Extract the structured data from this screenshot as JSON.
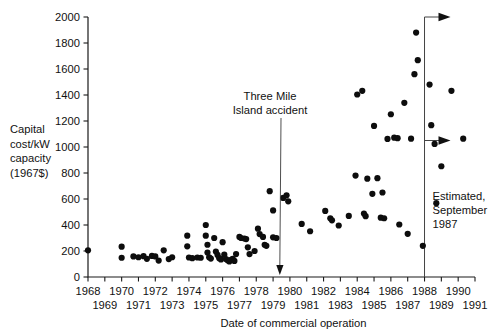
{
  "chart_data": {
    "type": "scatter",
    "title": "",
    "xlabel": "Date of commercial operation",
    "ylabel": "Capital cost/kW capacity (1967$)",
    "ylabel_lines": [
      "Capital",
      "cost/kW",
      "capacity",
      "(1967$)"
    ],
    "xlim": [
      1968,
      1991
    ],
    "ylim": [
      0,
      2000
    ],
    "grid": false,
    "legend": null,
    "ytick_values": [
      0,
      200,
      400,
      600,
      800,
      1000,
      1200,
      1400,
      1600,
      1800,
      2000
    ],
    "ytick_labels": [
      "0",
      "200",
      "400",
      "600",
      "800",
      "1000",
      "1200",
      "1400",
      "1600",
      "1800",
      "2000"
    ],
    "xtick_values": [
      1968,
      1969,
      1970,
      1971,
      1972,
      1973,
      1974,
      1975,
      1976,
      1977,
      1978,
      1979,
      1980,
      1981,
      1982,
      1983,
      1984,
      1985,
      1986,
      1987,
      1988,
      1989,
      1990,
      1991
    ],
    "xtick_labels_upper": [
      "1968",
      "1970",
      "1972",
      "1974",
      "1976",
      "1978",
      "1980",
      "1982",
      "1984",
      "1986",
      "1988",
      "1990"
    ],
    "xtick_labels_lower": [
      "1969",
      "1971",
      "1973",
      "1975",
      "1977",
      "1979",
      "1981",
      "1983",
      "1985",
      "1987",
      "1989",
      "1991"
    ],
    "annotations": [
      {
        "name": "three-mile-island",
        "lines": [
          "Three Mile",
          "Island accident"
        ],
        "text": "Three Mile Island accident",
        "points_to_x": 1979.4,
        "points_to_y": 0
      },
      {
        "name": "estimated-september-1987",
        "lines": [
          "Estimated,",
          "September",
          "1987"
        ],
        "text": "Estimated, September 1987",
        "marker_x": 1988.0
      }
    ],
    "reference_line": {
      "x": 1988.0,
      "y_from": 0,
      "y_to": 2000,
      "arrows_at_y": [
        2000,
        1050
      ]
    },
    "points": [
      {
        "x": 1968.0,
        "y": 205
      },
      {
        "x": 1970.0,
        "y": 233
      },
      {
        "x": 1970.0,
        "y": 148
      },
      {
        "x": 1970.7,
        "y": 158
      },
      {
        "x": 1971.0,
        "y": 152
      },
      {
        "x": 1971.3,
        "y": 160
      },
      {
        "x": 1971.5,
        "y": 140
      },
      {
        "x": 1971.8,
        "y": 162
      },
      {
        "x": 1972.0,
        "y": 158
      },
      {
        "x": 1972.2,
        "y": 126
      },
      {
        "x": 1972.5,
        "y": 205
      },
      {
        "x": 1972.8,
        "y": 138
      },
      {
        "x": 1973.0,
        "y": 152
      },
      {
        "x": 1973.9,
        "y": 318
      },
      {
        "x": 1973.9,
        "y": 236
      },
      {
        "x": 1974.0,
        "y": 150
      },
      {
        "x": 1974.2,
        "y": 145
      },
      {
        "x": 1974.5,
        "y": 150
      },
      {
        "x": 1974.7,
        "y": 148
      },
      {
        "x": 1975.0,
        "y": 400
      },
      {
        "x": 1975.0,
        "y": 318
      },
      {
        "x": 1975.1,
        "y": 248
      },
      {
        "x": 1975.1,
        "y": 188
      },
      {
        "x": 1975.2,
        "y": 152
      },
      {
        "x": 1975.3,
        "y": 142
      },
      {
        "x": 1975.5,
        "y": 300
      },
      {
        "x": 1975.6,
        "y": 196
      },
      {
        "x": 1975.7,
        "y": 170
      },
      {
        "x": 1975.8,
        "y": 145
      },
      {
        "x": 1975.9,
        "y": 135
      },
      {
        "x": 1976.0,
        "y": 268
      },
      {
        "x": 1976.1,
        "y": 172
      },
      {
        "x": 1976.2,
        "y": 138
      },
      {
        "x": 1976.3,
        "y": 128
      },
      {
        "x": 1976.4,
        "y": 120
      },
      {
        "x": 1976.5,
        "y": 132
      },
      {
        "x": 1976.6,
        "y": 140
      },
      {
        "x": 1976.7,
        "y": 124
      },
      {
        "x": 1976.8,
        "y": 176
      },
      {
        "x": 1977.0,
        "y": 308
      },
      {
        "x": 1977.1,
        "y": 300
      },
      {
        "x": 1977.3,
        "y": 296
      },
      {
        "x": 1977.4,
        "y": 292
      },
      {
        "x": 1977.5,
        "y": 228
      },
      {
        "x": 1977.6,
        "y": 176
      },
      {
        "x": 1977.9,
        "y": 200
      },
      {
        "x": 1978.1,
        "y": 372
      },
      {
        "x": 1978.2,
        "y": 330
      },
      {
        "x": 1978.4,
        "y": 308
      },
      {
        "x": 1978.5,
        "y": 248
      },
      {
        "x": 1978.6,
        "y": 240
      },
      {
        "x": 1978.8,
        "y": 660
      },
      {
        "x": 1979.0,
        "y": 512
      },
      {
        "x": 1979.0,
        "y": 305
      },
      {
        "x": 1979.2,
        "y": 300
      },
      {
        "x": 1979.6,
        "y": 608
      },
      {
        "x": 1979.8,
        "y": 628
      },
      {
        "x": 1979.9,
        "y": 582
      },
      {
        "x": 1980.7,
        "y": 408
      },
      {
        "x": 1981.2,
        "y": 352
      },
      {
        "x": 1982.1,
        "y": 508
      },
      {
        "x": 1982.4,
        "y": 452
      },
      {
        "x": 1982.5,
        "y": 436
      },
      {
        "x": 1982.9,
        "y": 396
      },
      {
        "x": 1983.5,
        "y": 470
      },
      {
        "x": 1983.9,
        "y": 780
      },
      {
        "x": 1984.0,
        "y": 1404
      },
      {
        "x": 1984.3,
        "y": 1432
      },
      {
        "x": 1984.4,
        "y": 488
      },
      {
        "x": 1984.5,
        "y": 468
      },
      {
        "x": 1984.6,
        "y": 756
      },
      {
        "x": 1984.9,
        "y": 640
      },
      {
        "x": 1985.0,
        "y": 1162
      },
      {
        "x": 1985.2,
        "y": 760
      },
      {
        "x": 1985.4,
        "y": 456
      },
      {
        "x": 1985.5,
        "y": 650
      },
      {
        "x": 1985.6,
        "y": 452
      },
      {
        "x": 1985.8,
        "y": 1062
      },
      {
        "x": 1986.0,
        "y": 1252
      },
      {
        "x": 1986.2,
        "y": 1072
      },
      {
        "x": 1986.4,
        "y": 1068
      },
      {
        "x": 1986.5,
        "y": 404
      },
      {
        "x": 1986.8,
        "y": 1340
      },
      {
        "x": 1987.0,
        "y": 332
      },
      {
        "x": 1987.2,
        "y": 1064
      },
      {
        "x": 1987.4,
        "y": 1560
      },
      {
        "x": 1987.5,
        "y": 1880
      },
      {
        "x": 1987.6,
        "y": 1668
      },
      {
        "x": 1987.9,
        "y": 240
      },
      {
        "x": 1988.3,
        "y": 1480
      },
      {
        "x": 1988.4,
        "y": 1168
      },
      {
        "x": 1988.6,
        "y": 1024
      },
      {
        "x": 1988.7,
        "y": 568
      },
      {
        "x": 1989.0,
        "y": 852
      },
      {
        "x": 1989.6,
        "y": 1432
      },
      {
        "x": 1990.3,
        "y": 1064
      }
    ]
  }
}
